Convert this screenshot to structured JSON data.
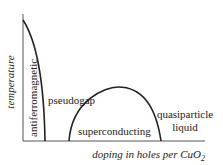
{
  "diagram": {
    "type": "phase-diagram",
    "y_axis_label": "temperature",
    "x_axis_label_prefix": "doping in holes per CuO",
    "x_axis_label_subscript": "2",
    "regions": {
      "antiferromagnetic": "antiferromagnetic",
      "pseudogap": "pseudogap",
      "superconducting": "superconducting",
      "quasiparticle_line1": "quasiparticle",
      "quasiparticle_line2": "liquid"
    },
    "colors": {
      "line": "#222222",
      "text": "#222222",
      "background": "#ffffff"
    }
  }
}
